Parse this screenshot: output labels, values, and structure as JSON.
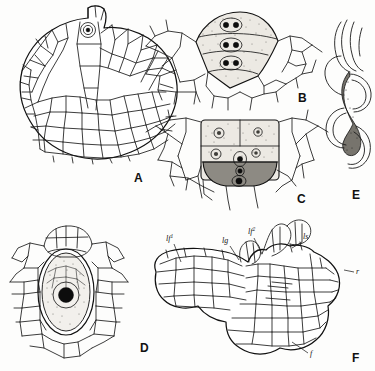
{
  "plate": {
    "title": "Fern gametophyte development plate",
    "background_color": "#fdfdfc",
    "ink_color": "#1a1a1a",
    "width": 375,
    "height": 371
  },
  "panels": [
    {
      "id": "A",
      "letter": "A",
      "name": "prothallus-surface-view",
      "caption": "A",
      "description": "Heart-shaped prothallus in surface view showing cellular network and apical notch with a single dark marked cell",
      "letter_x": 134,
      "letter_y": 182
    },
    {
      "id": "B",
      "letter": "B",
      "name": "antheridium-young",
      "caption": "B",
      "description": "Young antheridium: three stippled tiers of cells each containing dark nuclei, surrounded by prothallial cells",
      "letter_x": 298,
      "letter_y": 102
    },
    {
      "id": "C",
      "letter": "C",
      "name": "antheridium-mature",
      "caption": "C",
      "description": "Older antheridium in four tiers, lowest tier heavily shaded with a large dark body",
      "letter_x": 297,
      "letter_y": 203
    },
    {
      "id": "D",
      "letter": "D",
      "name": "archegonium-with-egg",
      "caption": "D",
      "description": "Archegonium in longitudinal section: venter containing large egg cell with dense black nucleus, neck cells above",
      "letter_x": 140,
      "letter_y": 352
    },
    {
      "id": "E",
      "letter": "E",
      "name": "antherozoid-spermatozoid",
      "caption": "E",
      "description": "Spiral multiflagellate antherozoid (spermatozoid) escaping, with coiled body and long flagella",
      "letter_x": 352,
      "letter_y": 199
    },
    {
      "id": "F",
      "letter": "F",
      "name": "young-sporophyte-embryo",
      "caption": "F",
      "description": "Median section of young sporophyte embryo attached to prothallus showing first and second leaves, ligule, leaf sheath, root and foot",
      "letter_x": 352,
      "letter_y": 362
    }
  ],
  "callouts": [
    {
      "id": "lf1",
      "name": "label-first-leaf",
      "base": "lf",
      "sup": "1",
      "x": 166,
      "y": 241,
      "leader": [
        [
          174,
          244
        ],
        [
          181,
          262
        ]
      ]
    },
    {
      "id": "lg",
      "name": "label-ligule",
      "base": "lg",
      "sup": "",
      "x": 222,
      "y": 243,
      "leader": [
        [
          230,
          246
        ],
        [
          239,
          260
        ]
      ]
    },
    {
      "id": "lf2",
      "name": "label-second-leaf",
      "base": "lf",
      "sup": "2",
      "x": 248,
      "y": 234,
      "leader": [
        [
          254,
          238
        ],
        [
          262,
          254
        ]
      ]
    },
    {
      "id": "ls",
      "name": "label-leaf-sheath",
      "base": "ls",
      "sup": "",
      "x": 303,
      "y": 239,
      "leader": [
        [
          302,
          242
        ],
        [
          292,
          248
        ]
      ]
    },
    {
      "id": "r",
      "name": "label-root",
      "base": "r",
      "sup": "",
      "x": 356,
      "y": 274,
      "leader": [
        [
          354,
          272
        ],
        [
          344,
          270
        ]
      ]
    },
    {
      "id": "f",
      "name": "label-foot",
      "base": "f",
      "sup": "",
      "x": 310,
      "y": 356,
      "leader": [
        [
          308,
          353
        ],
        [
          292,
          342
        ]
      ]
    }
  ]
}
